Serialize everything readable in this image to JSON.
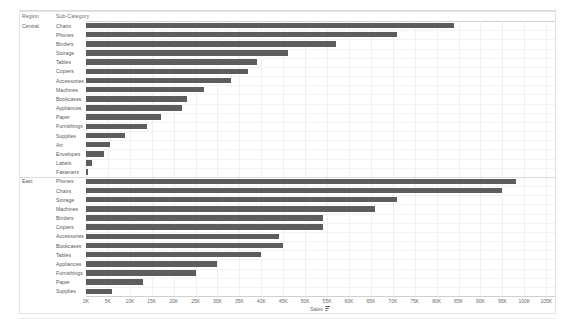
{
  "worksheet": {
    "columns": {
      "region_header": "Region",
      "subcategory_header": "Sub-Category"
    },
    "axis_title": "Sales",
    "sort_icon": "sort-descending-icon"
  },
  "chart_data": {
    "type": "bar",
    "orientation": "horizontal",
    "title": "",
    "xlabel": "Sales",
    "ylabel": "",
    "xlim": [
      0,
      107000
    ],
    "grid": true,
    "legend": false,
    "bar_color": "#5d5d5d",
    "tick_labels": [
      "0K",
      "5K",
      "10K",
      "15K",
      "20K",
      "25K",
      "30K",
      "35K",
      "40K",
      "45K",
      "50K",
      "55K",
      "60K",
      "65K",
      "70K",
      "75K",
      "80K",
      "85K",
      "90K",
      "95K",
      "100K",
      "105K"
    ],
    "tick_values": [
      0,
      5000,
      10000,
      15000,
      20000,
      25000,
      30000,
      35000,
      40000,
      45000,
      50000,
      55000,
      60000,
      65000,
      70000,
      75000,
      80000,
      85000,
      90000,
      95000,
      100000,
      105000
    ],
    "groups": [
      {
        "name": "Central",
        "categories": [
          "Chairs",
          "Phones",
          "Binders",
          "Storage",
          "Tables",
          "Copiers",
          "Accessories",
          "Machines",
          "Bookcases",
          "Appliances",
          "Paper",
          "Furnishings",
          "Supplies",
          "Art",
          "Envelopes",
          "Labels",
          "Fasteners"
        ],
        "values": [
          84000,
          71000,
          57000,
          46000,
          39000,
          37000,
          33000,
          27000,
          23000,
          22000,
          17000,
          14000,
          9000,
          5500,
          4000,
          1400,
          500
        ]
      },
      {
        "name": "East",
        "categories": [
          "Phones",
          "Chairs",
          "Storage",
          "Machines",
          "Binders",
          "Copiers",
          "Accessories",
          "Bookcases",
          "Tables",
          "Appliances",
          "Furnishings",
          "Paper",
          "Supplies"
        ],
        "values": [
          98000,
          95000,
          71000,
          66000,
          54000,
          54000,
          44000,
          45000,
          40000,
          30000,
          25000,
          13000,
          6000
        ]
      }
    ]
  }
}
